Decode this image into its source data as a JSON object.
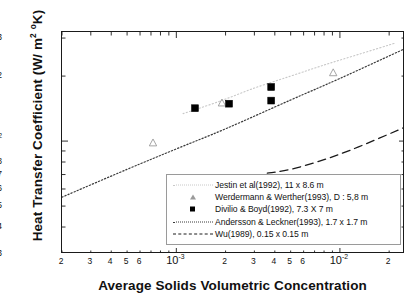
{
  "axes": {
    "y_title": "Heat Transfer Coefficient (W/ m",
    "y_title_sup1": "2",
    "y_title_mid": " ",
    "y_title_sup2": "o",
    "y_title_end": "K)",
    "x_title": "Average Solids Volumetric Concentration"
  },
  "ticks": {
    "y": [
      {
        "label": "3",
        "value": 300,
        "major": false
      },
      {
        "label": "2",
        "value": 200,
        "major": false
      },
      {
        "label": "10",
        "sup": "2",
        "value": 100,
        "major": true
      },
      {
        "label": "8",
        "value": 80,
        "major": false
      },
      {
        "label": "7",
        "value": 70,
        "major": false
      },
      {
        "label": "6",
        "value": 60,
        "major": false
      },
      {
        "label": "5",
        "value": 50,
        "major": false
      },
      {
        "label": "4",
        "value": 40,
        "major": false
      },
      {
        "label": "3",
        "value": 30,
        "major": false
      }
    ],
    "x": [
      {
        "label": "2",
        "value": 0.0002,
        "major": false
      },
      {
        "label": "3",
        "value": 0.0003,
        "major": false
      },
      {
        "label": "4",
        "value": 0.0004,
        "major": false
      },
      {
        "label": "5",
        "value": 0.0005,
        "major": false
      },
      {
        "label": "6",
        "value": 0.0006,
        "major": false
      },
      {
        "label": "10",
        "sup": "-3",
        "value": 0.001,
        "major": true
      },
      {
        "label": "2",
        "value": 0.002,
        "major": false
      },
      {
        "label": "3",
        "value": 0.003,
        "major": false
      },
      {
        "label": "4",
        "value": 0.004,
        "major": false
      },
      {
        "label": "5",
        "value": 0.005,
        "major": false
      },
      {
        "label": "6",
        "value": 0.006,
        "major": false
      },
      {
        "label": "10",
        "sup": "-2",
        "value": 0.01,
        "major": true
      },
      {
        "label": "2",
        "value": 0.02,
        "major": false
      }
    ]
  },
  "legend": {
    "items": [
      {
        "label": "Jestin et al(1992),  11  x 8.6 m",
        "style": "dotted-light",
        "marker": "none"
      },
      {
        "label": "Werdermann & Werther(1993), D : 5,8 m",
        "style": "none",
        "marker": "open-triangle"
      },
      {
        "label": "Divilio & Boyd(1992),   7.3 X 7 m",
        "style": "none",
        "marker": "filled-square"
      },
      {
        "label": "Andersson & Leckner(1993), 1.7 x 1.7 m",
        "style": "dotted",
        "marker": "none"
      },
      {
        "label": "Wu(1989), 0.15 x 0.15 m",
        "style": "long-dash",
        "marker": "none"
      }
    ]
  },
  "chart_data": {
    "type": "scatter",
    "title": "",
    "xlabel": "Average Solids Volumetric Concentration",
    "ylabel": "Heat Transfer Coefficient (W/ m2 oK)",
    "xscale": "log",
    "yscale": "log",
    "xlim": [
      0.0002,
      0.025
    ],
    "ylim": [
      30,
      320
    ],
    "grid": false,
    "legend_position": "bottom-right",
    "series": [
      {
        "name": "Jestin et al(1992),  11  x 8.6 m",
        "type": "line",
        "style": "dotted-light",
        "color": "#c8c8c8",
        "x": [
          0.0011,
          0.0018,
          0.003,
          0.005,
          0.008,
          0.013,
          0.022
        ],
        "y": [
          134,
          152,
          176,
          200,
          225,
          252,
          285
        ]
      },
      {
        "name": "Werdermann & Werther(1993), D : 5,8 m",
        "type": "scatter",
        "marker": "open-triangle",
        "color": "#9a9a9a",
        "x": [
          0.00072,
          0.0019,
          0.0091
        ],
        "y": [
          98,
          150,
          207
        ]
      },
      {
        "name": "Divilio & Boyd(1992),   7.3 X 7 m",
        "type": "scatter",
        "marker": "filled-square",
        "color": "#000000",
        "x": [
          0.0013,
          0.0021,
          0.0038,
          0.0038
        ],
        "y": [
          142,
          149,
          154,
          178
        ]
      },
      {
        "name": "Andersson & Leckner(1993), 1.7 x 1.7 m",
        "type": "line",
        "style": "dotted",
        "color": "#3a3a3a",
        "x": [
          0.0002,
          0.0005,
          0.001,
          0.002,
          0.005,
          0.01,
          0.025
        ],
        "y": [
          55,
          74,
          92,
          114,
          155,
          195,
          268
        ]
      },
      {
        "name": "Wu(1989), 0.15 x 0.15 m",
        "type": "line",
        "style": "long-dash",
        "color": "#1a1a1a",
        "x": [
          0.0036,
          0.005,
          0.008,
          0.013,
          0.025
        ],
        "y": [
          71,
          74,
          82,
          94,
          116
        ]
      }
    ]
  }
}
